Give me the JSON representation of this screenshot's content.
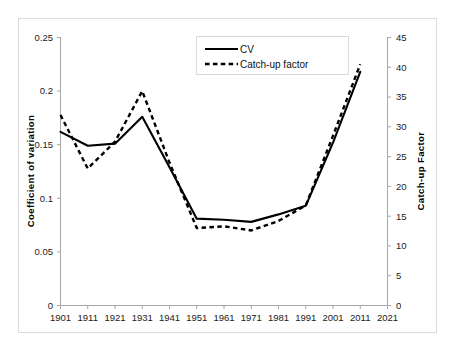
{
  "chart_data": {
    "type": "line",
    "title": "",
    "xlabel": "",
    "ylabel": "Coefficient of variation",
    "y2label": "Catch-up Factor",
    "grid": false,
    "legend_position": "top-center",
    "xlim": [
      1901,
      2021
    ],
    "ylim": [
      0,
      0.25
    ],
    "y2lim": [
      0,
      45
    ],
    "x_tick_labels": [
      "1901",
      "1911",
      "1921",
      "1931",
      "1941",
      "1951",
      "1961",
      "1971",
      "1981",
      "1991",
      "2001",
      "2011",
      "2021"
    ],
    "y_tick_labels": [
      "0",
      "0.05",
      "0.1",
      "0.15",
      "0.2",
      "0.25"
    ],
    "y2_tick_labels": [
      "0",
      "5",
      "10",
      "15",
      "20",
      "25",
      "30",
      "35",
      "40",
      "45"
    ],
    "series": [
      {
        "name": "CV",
        "axis": "left",
        "style": "solid",
        "color": "#000000",
        "x": [
          1901,
          1911,
          1921,
          1931,
          1941,
          1951,
          1961,
          1971,
          1981,
          1991,
          2001,
          2011
        ],
        "values": [
          0.162,
          0.149,
          0.151,
          0.176,
          0.129,
          0.081,
          0.08,
          0.078,
          0.085,
          0.093,
          0.152,
          0.218
        ]
      },
      {
        "name": "Catch-up factor",
        "axis": "right",
        "style": "dashed",
        "color": "#000000",
        "x": [
          1901,
          1911,
          1921,
          1931,
          1941,
          1951,
          1961,
          1971,
          1981,
          1991,
          2001,
          2011
        ],
        "values": [
          32.0,
          23.0,
          27.5,
          36.0,
          24.0,
          13.0,
          13.3,
          12.6,
          14.2,
          16.8,
          28.5,
          40.5
        ]
      }
    ]
  },
  "axes": {
    "left_title": "Coefficient of variation",
    "right_title": "Catch-up Factor"
  },
  "legend": {
    "entries": [
      {
        "label": "CV",
        "style": "solid"
      },
      {
        "label": "Catch-up factor",
        "style": "dashed"
      }
    ]
  }
}
